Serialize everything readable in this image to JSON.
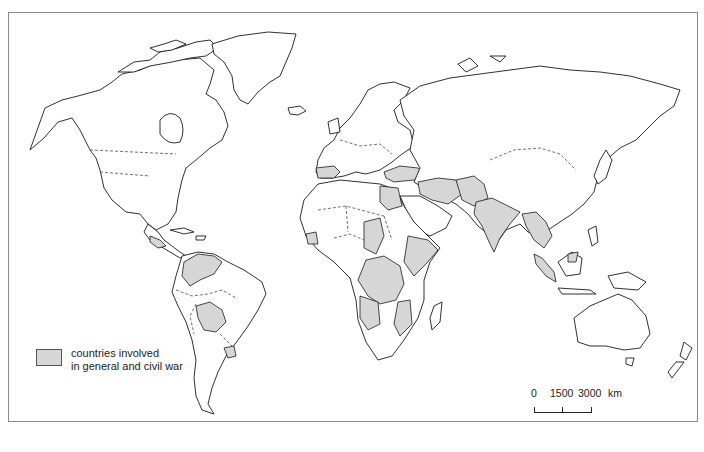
{
  "map": {
    "title": "",
    "style": "outline world map, grayscale",
    "colors": {
      "land": "#ffffff",
      "outline": "#1a1a1a",
      "war_fill": "#d6d6d6",
      "frame": "#8a8a8a"
    },
    "shaded_regions": [
      "Central America (Guatemala, El Salvador, Nicaragua)",
      "Colombia / Venezuela",
      "Bolivia / Paraguay",
      "Uruguay",
      "Spain",
      "Turkey",
      "Iran / Iraq / Syria",
      "Afghanistan / Pakistan",
      "India",
      "Burma / Thailand / Indochina",
      "Sumatra",
      "Borneo (part)",
      "Egypt",
      "Chad",
      "Ethiopia / Somalia",
      "Congo / Central Africa",
      "Angola",
      "Mozambique / Zimbabwe",
      "West Africa (Senegal, Guinea)"
    ]
  },
  "legend": {
    "swatch_color": "#d6d6d6",
    "line1": "countries involved",
    "line2": "in general and civil war"
  },
  "scale": {
    "tick0": "0",
    "tick1": "1500",
    "tick2": "3000",
    "unit": "km"
  }
}
